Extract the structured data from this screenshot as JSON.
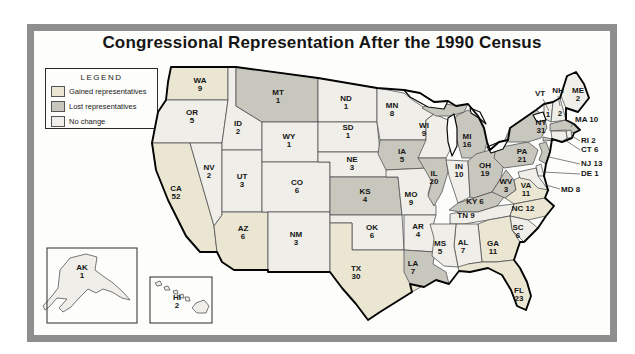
{
  "map": {
    "title": "Congressional Representation After the 1990 Census"
  },
  "legend": {
    "title": "LEGEND",
    "items": [
      {
        "key": "gained",
        "label": "Gained representatives",
        "color": "#ebe6d2"
      },
      {
        "key": "lost",
        "label": "Lost representatives",
        "color": "#c8c7bd"
      },
      {
        "key": "nochange",
        "label": "No change",
        "color": "#efeee8"
      }
    ]
  },
  "frame_color": "#8e8e8e",
  "states": [
    {
      "abbr": "WA",
      "seats": 9,
      "status": "gained"
    },
    {
      "abbr": "OR",
      "seats": 5,
      "status": "nochange"
    },
    {
      "abbr": "CA",
      "seats": 52,
      "status": "gained"
    },
    {
      "abbr": "NV",
      "seats": 2,
      "status": "nochange"
    },
    {
      "abbr": "ID",
      "seats": 2,
      "status": "nochange"
    },
    {
      "abbr": "UT",
      "seats": 3,
      "status": "nochange"
    },
    {
      "abbr": "AZ",
      "seats": 6,
      "status": "gained"
    },
    {
      "abbr": "MT",
      "seats": 1,
      "status": "lost"
    },
    {
      "abbr": "WY",
      "seats": 1,
      "status": "nochange"
    },
    {
      "abbr": "CO",
      "seats": 6,
      "status": "nochange"
    },
    {
      "abbr": "NM",
      "seats": 3,
      "status": "nochange"
    },
    {
      "abbr": "ND",
      "seats": 1,
      "status": "nochange"
    },
    {
      "abbr": "SD",
      "seats": 1,
      "status": "nochange"
    },
    {
      "abbr": "NE",
      "seats": 3,
      "status": "nochange"
    },
    {
      "abbr": "KS",
      "seats": 4,
      "status": "lost"
    },
    {
      "abbr": "OK",
      "seats": 6,
      "status": "nochange"
    },
    {
      "abbr": "TX",
      "seats": 30,
      "status": "gained"
    },
    {
      "abbr": "MN",
      "seats": 8,
      "status": "nochange"
    },
    {
      "abbr": "IA",
      "seats": 5,
      "status": "lost"
    },
    {
      "abbr": "MO",
      "seats": 9,
      "status": "nochange"
    },
    {
      "abbr": "AR",
      "seats": 4,
      "status": "nochange"
    },
    {
      "abbr": "LA",
      "seats": 7,
      "status": "lost"
    },
    {
      "abbr": "WI",
      "seats": 9,
      "status": "nochange"
    },
    {
      "abbr": "IL",
      "seats": 20,
      "status": "lost"
    },
    {
      "abbr": "IN",
      "seats": 10,
      "status": "nochange"
    },
    {
      "abbr": "MI",
      "seats": 16,
      "status": "lost"
    },
    {
      "abbr": "OH",
      "seats": 19,
      "status": "lost"
    },
    {
      "abbr": "KY",
      "seats": 6,
      "status": "lost"
    },
    {
      "abbr": "TN",
      "seats": 9,
      "status": "nochange"
    },
    {
      "abbr": "WV",
      "seats": 3,
      "status": "lost"
    },
    {
      "abbr": "VA",
      "seats": 11,
      "status": "gained"
    },
    {
      "abbr": "NC",
      "seats": 12,
      "status": "gained"
    },
    {
      "abbr": "SC",
      "seats": 6,
      "status": "nochange"
    },
    {
      "abbr": "GA",
      "seats": 11,
      "status": "gained"
    },
    {
      "abbr": "AL",
      "seats": 7,
      "status": "nochange"
    },
    {
      "abbr": "MS",
      "seats": 5,
      "status": "nochange"
    },
    {
      "abbr": "FL",
      "seats": 23,
      "status": "gained"
    },
    {
      "abbr": "PA",
      "seats": 21,
      "status": "lost"
    },
    {
      "abbr": "NY",
      "seats": 31,
      "status": "lost"
    },
    {
      "abbr": "VT",
      "seats": 1,
      "status": "nochange"
    },
    {
      "abbr": "NH",
      "seats": 2,
      "status": "nochange"
    },
    {
      "abbr": "ME",
      "seats": 2,
      "status": "nochange"
    },
    {
      "abbr": "MA",
      "seats": 10,
      "status": "lost"
    },
    {
      "abbr": "RI",
      "seats": 2,
      "status": "nochange"
    },
    {
      "abbr": "CT",
      "seats": 6,
      "status": "nochange"
    },
    {
      "abbr": "NJ",
      "seats": 13,
      "status": "lost"
    },
    {
      "abbr": "DE",
      "seats": 1,
      "status": "nochange"
    },
    {
      "abbr": "MD",
      "seats": 8,
      "status": "nochange"
    },
    {
      "abbr": "AK",
      "seats": 1,
      "status": "nochange"
    },
    {
      "abbr": "HI",
      "seats": 2,
      "status": "nochange"
    }
  ]
}
